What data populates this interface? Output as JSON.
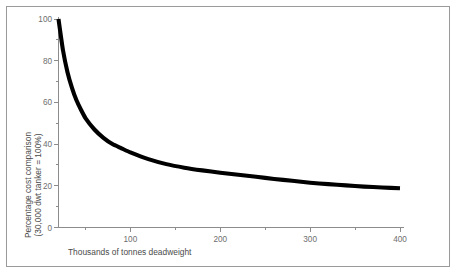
{
  "figure": {
    "border_color": "#9a9a9a",
    "background_color": "#ffffff",
    "axis_color": "#8c8c8c",
    "curve_color": "#000000",
    "label_color": "#6e6e6e"
  },
  "chart_data": {
    "type": "line",
    "title": "",
    "subtitle": "",
    "xlabel": "Thousands of tonnes deadweight",
    "ylabel_line1": "Percentage cost comparison",
    "ylabel_line2": "(30,000 dwt tanker = 100%)",
    "ylabel": "Percentage cost comparison (30,000 dwt tanker = 100%)",
    "xlim": [
      20,
      400
    ],
    "ylim": [
      0,
      100
    ],
    "grid": false,
    "legend": false,
    "x_major_ticks": [
      100,
      200,
      300,
      400
    ],
    "x_major_tick_labels": [
      "100",
      "200",
      "300",
      "400"
    ],
    "x_minor_ticks": [
      50,
      150,
      250,
      350
    ],
    "y_major_ticks": [
      0,
      20,
      40,
      60,
      80,
      100
    ],
    "y_major_tick_labels": [
      "0",
      "20",
      "40",
      "60",
      "80",
      "100"
    ],
    "y_minor_ticks": [
      10,
      30,
      50,
      70,
      90
    ],
    "series": [
      {
        "name": "Percentage cost comparison",
        "x": [
          20,
          25,
          30,
          35,
          40,
          45,
          50,
          60,
          70,
          80,
          90,
          100,
          120,
          140,
          160,
          180,
          200,
          220,
          240,
          260,
          280,
          300,
          320,
          340,
          360,
          380,
          400
        ],
        "values": [
          100,
          85,
          74.5,
          67,
          61,
          56.5,
          52.5,
          47,
          43,
          40,
          38,
          36,
          32.8,
          30.4,
          28.7,
          27.4,
          26.3,
          25.3,
          24.3,
          23.3,
          22.4,
          21.5,
          20.8,
          20.2,
          19.6,
          19.2,
          18.8
        ]
      }
    ]
  }
}
